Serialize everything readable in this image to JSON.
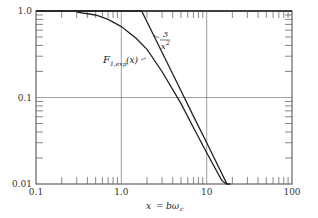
{
  "chart_data": {
    "type": "line",
    "title": "",
    "xlabel": "x = bω_c",
    "ylabel": "",
    "xscale": "log",
    "yscale": "log",
    "xlim": [
      0.1,
      100
    ],
    "ylim": [
      0.01,
      1.0
    ],
    "grid": true,
    "x_ticks": [
      "0.1",
      "1.0",
      "10",
      "100"
    ],
    "y_ticks": [
      "0.01",
      "0.1",
      "1.0"
    ],
    "series": [
      {
        "name": "F_{1,exp}(x)",
        "label": "F1,exp(x)",
        "x": [
          0.3,
          0.5,
          0.7,
          1.0,
          1.5,
          2.0,
          3.0,
          5.0,
          7.0,
          10.0,
          15.0,
          17.0
        ],
        "y": [
          0.97,
          0.9,
          0.8,
          0.66,
          0.48,
          0.36,
          0.2,
          0.085,
          0.045,
          0.023,
          0.011,
          0.0085
        ]
      },
      {
        "name": "3/x^2",
        "label": "3/x²",
        "x": [
          0.1,
          1.73,
          2.0,
          3.0,
          5.0,
          7.0,
          10.0,
          17.3,
          19.0
        ],
        "y": [
          1.0,
          1.0,
          0.75,
          0.333,
          0.12,
          0.061,
          0.03,
          0.01,
          0.0083
        ]
      }
    ],
    "annotations": [
      {
        "text": "3/x²",
        "near": [
          2.2,
          0.75
        ]
      },
      {
        "text": "F1,exp(x)",
        "near": [
          1.4,
          0.36
        ]
      }
    ]
  },
  "labels": {
    "y_1": "1.0",
    "y_01": "0.1",
    "y_001": "0.01",
    "x_01": "0.1",
    "x_1": "1.0",
    "x_10": "10",
    "x_100": "100",
    "xlabel_x": "x",
    "xlabel_eq": "=",
    "xlabel_b": "bω",
    "xlabel_sub": "c",
    "ann_three": "3",
    "ann_x": "x",
    "ann_sq": "2",
    "ann_F": "F",
    "ann_Fsub": "1,exp",
    "ann_Farg": "(x)"
  }
}
